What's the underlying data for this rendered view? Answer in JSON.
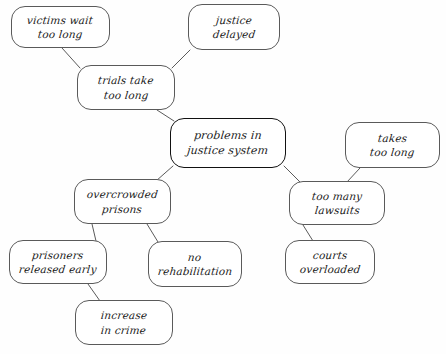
{
  "diagram": {
    "style": "hand-drawn rounded rectangles with pencil connector lines",
    "ink_color": "#5a5a5a",
    "central_ink_color": "#111111",
    "background_color": "#fefefe"
  },
  "nodes": [
    {
      "id": "victims-wait-too-long",
      "lines": [
        "victims wait",
        "too long"
      ],
      "x": 11,
      "y": 6,
      "w": 99,
      "h": 42,
      "central": false
    },
    {
      "id": "justice-delayed",
      "lines": [
        "justice",
        "delayed"
      ],
      "x": 188,
      "y": 4,
      "w": 92,
      "h": 46,
      "central": false
    },
    {
      "id": "trials-take-too-long",
      "lines": [
        "trials take",
        "too long"
      ],
      "x": 77,
      "y": 65,
      "w": 98,
      "h": 45,
      "central": false
    },
    {
      "id": "problems-in-justice-system",
      "lines": [
        "problems in",
        "justice system"
      ],
      "x": 170,
      "y": 118,
      "w": 116,
      "h": 50,
      "central": true
    },
    {
      "id": "takes-too-long",
      "lines": [
        "takes",
        "too long"
      ],
      "x": 345,
      "y": 122,
      "w": 95,
      "h": 46,
      "central": false
    },
    {
      "id": "overcrowded-prisons",
      "lines": [
        "overcrowded",
        "prisons"
      ],
      "x": 74,
      "y": 179,
      "w": 97,
      "h": 45,
      "central": false
    },
    {
      "id": "too-many-lawsuits",
      "lines": [
        "too many",
        "lawsuits"
      ],
      "x": 289,
      "y": 181,
      "w": 96,
      "h": 44,
      "central": false
    },
    {
      "id": "prisoners-released-early",
      "lines": [
        "prisoners",
        "released early"
      ],
      "x": 9,
      "y": 240,
      "w": 98,
      "h": 44,
      "central": false
    },
    {
      "id": "no-rehabilitation",
      "lines": [
        "no",
        "rehabilitation"
      ],
      "x": 148,
      "y": 241,
      "w": 94,
      "h": 46,
      "central": false
    },
    {
      "id": "courts-overloaded",
      "lines": [
        "courts",
        "overloaded"
      ],
      "x": 285,
      "y": 240,
      "w": 90,
      "h": 44,
      "central": false
    },
    {
      "id": "increase-in-crime",
      "lines": [
        "increase",
        "in crime"
      ],
      "x": 75,
      "y": 300,
      "w": 98,
      "h": 45,
      "central": false
    }
  ],
  "edges": [
    {
      "id": "edge-victims-to-trials",
      "from": "victims-wait-too-long",
      "to": "trials-take-too-long",
      "x1": 62,
      "y1": 48,
      "x2": 80,
      "y2": 68
    },
    {
      "id": "edge-justice-delayed-to-trials",
      "from": "justice-delayed",
      "to": "trials-take-too-long",
      "x1": 190,
      "y1": 50,
      "x2": 172,
      "y2": 68
    },
    {
      "id": "edge-trials-to-problems",
      "from": "trials-take-too-long",
      "to": "problems-in-justice-system",
      "x1": 157,
      "y1": 110,
      "x2": 174,
      "y2": 121
    },
    {
      "id": "edge-problems-to-overcrowded",
      "from": "problems-in-justice-system",
      "to": "overcrowded-prisons",
      "x1": 173,
      "y1": 166,
      "x2": 156,
      "y2": 181
    },
    {
      "id": "edge-problems-to-lawsuits",
      "from": "problems-in-justice-system",
      "to": "too-many-lawsuits",
      "x1": 284,
      "y1": 166,
      "x2": 301,
      "y2": 183
    },
    {
      "id": "edge-takes-too-long-to-lawsuits",
      "from": "takes-too-long",
      "to": "too-many-lawsuits",
      "x1": 360,
      "y1": 168,
      "x2": 347,
      "y2": 182
    },
    {
      "id": "edge-lawsuits-to-courts",
      "from": "too-many-lawsuits",
      "to": "courts-overloaded",
      "x1": 303,
      "y1": 225,
      "x2": 313,
      "y2": 241
    },
    {
      "id": "edge-overcrowded-to-prisoners",
      "from": "overcrowded-prisons",
      "to": "prisoners-released-early",
      "x1": 92,
      "y1": 224,
      "x2": 96,
      "y2": 241
    },
    {
      "id": "edge-overcrowded-to-no-rehab",
      "from": "overcrowded-prisons",
      "to": "no-rehabilitation",
      "x1": 147,
      "y1": 224,
      "x2": 158,
      "y2": 242
    },
    {
      "id": "edge-prisoners-to-increase-crime",
      "from": "prisoners-released-early",
      "to": "increase-in-crime",
      "x1": 88,
      "y1": 284,
      "x2": 100,
      "y2": 301
    }
  ]
}
